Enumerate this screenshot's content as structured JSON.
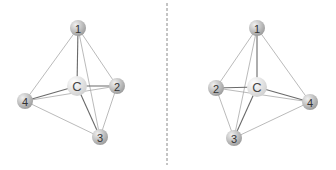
{
  "figure": {
    "colors": {
      "background": "#ffffff",
      "substituent_fill_light": "#f0f0f0",
      "substituent_fill_dark": "#9a9a9a",
      "center_fill_light": "#ffffff",
      "center_fill_dark": "#cfcfcf",
      "bond_front": "#6a6a6a",
      "edge_line": "#a8a8a8",
      "mirror_line": "#8a8a8a"
    },
    "mirror": {
      "x": 167,
      "y1": 3,
      "y2": 165,
      "dash": "3,2"
    },
    "molecules": [
      {
        "name": "left",
        "atoms": [
          {
            "id": "1",
            "label": "1",
            "x": 78,
            "y": 28,
            "r": 8,
            "kind": "substituent"
          },
          {
            "id": "C",
            "label": "C",
            "x": 77,
            "y": 86,
            "r": 10,
            "kind": "center"
          },
          {
            "id": "2",
            "label": "2",
            "x": 117,
            "y": 86,
            "r": 8,
            "kind": "substituent"
          },
          {
            "id": "4",
            "label": "4",
            "x": 25,
            "y": 101,
            "r": 8,
            "kind": "substituent"
          },
          {
            "id": "3",
            "label": "3",
            "x": 100,
            "y": 137,
            "r": 8,
            "kind": "substituent"
          }
        ],
        "edges": [
          [
            "1",
            "4"
          ],
          [
            "1",
            "2"
          ],
          [
            "1",
            "3"
          ],
          [
            "4",
            "2"
          ],
          [
            "4",
            "3"
          ],
          [
            "2",
            "3"
          ]
        ],
        "bonds": [
          [
            "C",
            "1"
          ],
          [
            "C",
            "2"
          ],
          [
            "C",
            "3"
          ],
          [
            "C",
            "4"
          ]
        ]
      },
      {
        "name": "right",
        "atoms": [
          {
            "id": "1",
            "label": "1",
            "x": 257,
            "y": 28,
            "r": 8,
            "kind": "substituent"
          },
          {
            "id": "C",
            "label": "C",
            "x": 257,
            "y": 87,
            "r": 10,
            "kind": "center"
          },
          {
            "id": "2",
            "label": "2",
            "x": 216,
            "y": 88,
            "r": 8,
            "kind": "substituent"
          },
          {
            "id": "4",
            "label": "4",
            "x": 310,
            "y": 102,
            "r": 8,
            "kind": "substituent"
          },
          {
            "id": "3",
            "label": "3",
            "x": 234,
            "y": 138,
            "r": 8,
            "kind": "substituent"
          }
        ],
        "edges": [
          [
            "1",
            "2"
          ],
          [
            "1",
            "4"
          ],
          [
            "1",
            "3"
          ],
          [
            "2",
            "4"
          ],
          [
            "2",
            "3"
          ],
          [
            "3",
            "4"
          ]
        ],
        "bonds": [
          [
            "C",
            "1"
          ],
          [
            "C",
            "2"
          ],
          [
            "C",
            "3"
          ],
          [
            "C",
            "4"
          ]
        ]
      }
    ]
  }
}
